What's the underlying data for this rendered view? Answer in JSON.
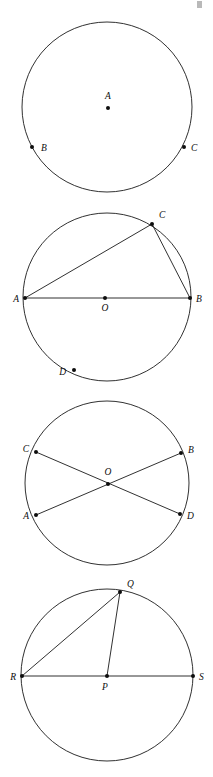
{
  "page": {
    "width": 213,
    "height": 777,
    "background_color": "#ffffff",
    "ink_color": "#1a1a1a",
    "figure_count": 4
  },
  "figures": [
    {
      "id": "figure-1",
      "name": "circle-with-center-and-two-points",
      "circle": {
        "cx": 107,
        "cy": 107,
        "r": 85
      },
      "points": [
        {
          "label": "A",
          "x": 108,
          "y": 108,
          "label_x": 108,
          "label_y": 99,
          "anchor": "middle",
          "role": "center"
        },
        {
          "label": "B",
          "x": 32,
          "y": 147,
          "label_x": 41,
          "label_y": 151,
          "anchor": "start",
          "role": "on-circle"
        },
        {
          "label": "C",
          "x": 184,
          "y": 147,
          "label_x": 191,
          "label_y": 151,
          "anchor": "start",
          "role": "on-circle"
        }
      ],
      "segments": []
    },
    {
      "id": "figure-2",
      "name": "circle-with-diameter-ab-inscribed-angle-c",
      "circle": {
        "cx": 107,
        "cy": 297,
        "r": 84
      },
      "points": [
        {
          "label": "A",
          "x": 25,
          "y": 298,
          "label_x": 19,
          "label_y": 302,
          "anchor": "end",
          "role": "on-circle"
        },
        {
          "label": "B",
          "x": 190,
          "y": 298,
          "label_x": 196,
          "label_y": 302,
          "anchor": "start",
          "role": "on-circle"
        },
        {
          "label": "C",
          "x": 152,
          "y": 224,
          "label_x": 159,
          "label_y": 218,
          "anchor": "start",
          "role": "on-circle"
        },
        {
          "label": "O",
          "x": 105,
          "y": 298,
          "label_x": 105,
          "label_y": 311,
          "anchor": "middle",
          "role": "center"
        },
        {
          "label": "D",
          "x": 74,
          "y": 370,
          "label_x": 66,
          "label_y": 375,
          "anchor": "end",
          "role": "interior"
        }
      ],
      "segments": [
        {
          "name": "diameter-AB",
          "x1": 25,
          "y1": 298,
          "x2": 190,
          "y2": 298
        },
        {
          "name": "chord-AC",
          "x1": 25,
          "y1": 298,
          "x2": 152,
          "y2": 224
        },
        {
          "name": "chord-CB",
          "x1": 152,
          "y1": 224,
          "x2": 190,
          "y2": 298
        }
      ]
    },
    {
      "id": "figure-3",
      "name": "circle-with-two-intersecting-diameters",
      "circle": {
        "cx": 107,
        "cy": 483,
        "r": 82
      },
      "points": [
        {
          "label": "C",
          "x": 36,
          "y": 452,
          "label_x": 29,
          "label_y": 452,
          "anchor": "end",
          "role": "on-circle"
        },
        {
          "label": "B",
          "x": 181,
          "y": 453,
          "label_x": 188,
          "label_y": 453,
          "anchor": "start",
          "role": "on-circle"
        },
        {
          "label": "A",
          "x": 36,
          "y": 515,
          "label_x": 29,
          "label_y": 519,
          "anchor": "end",
          "role": "on-circle"
        },
        {
          "label": "D",
          "x": 180,
          "y": 514,
          "label_x": 187,
          "label_y": 519,
          "anchor": "start",
          "role": "on-circle"
        },
        {
          "label": "O",
          "x": 108,
          "y": 484,
          "label_x": 108,
          "label_y": 475,
          "anchor": "middle",
          "role": "center"
        }
      ],
      "segments": [
        {
          "name": "diameter-CD",
          "x1": 36,
          "y1": 452,
          "x2": 180,
          "y2": 514
        },
        {
          "name": "diameter-AB",
          "x1": 36,
          "y1": 515,
          "x2": 181,
          "y2": 453
        }
      ]
    },
    {
      "id": "figure-4",
      "name": "circle-with-diameter-rs-and-radius-pq",
      "circle": {
        "cx": 107,
        "cy": 675,
        "r": 86
      },
      "points": [
        {
          "label": "R",
          "x": 22,
          "y": 676,
          "label_x": 16,
          "label_y": 680,
          "anchor": "end",
          "role": "on-circle"
        },
        {
          "label": "S",
          "x": 193,
          "y": 676,
          "label_x": 199,
          "label_y": 680,
          "anchor": "start",
          "role": "on-circle"
        },
        {
          "label": "Q",
          "x": 120,
          "y": 592,
          "label_x": 127,
          "label_y": 587,
          "anchor": "start",
          "role": "on-circle"
        },
        {
          "label": "P",
          "x": 107,
          "y": 676,
          "label_x": 105,
          "label_y": 690,
          "anchor": "middle",
          "role": "center"
        }
      ],
      "segments": [
        {
          "name": "diameter-RS",
          "x1": 22,
          "y1": 676,
          "x2": 193,
          "y2": 676
        },
        {
          "name": "chord-RQ",
          "x1": 22,
          "y1": 676,
          "x2": 120,
          "y2": 592
        },
        {
          "name": "radius-PQ",
          "x1": 107,
          "y1": 676,
          "x2": 120,
          "y2": 592
        }
      ]
    }
  ],
  "artifacts": [
    {
      "name": "top-right-scan-artifact",
      "x": 197,
      "y": 1,
      "width": 5,
      "height": 7
    }
  ]
}
